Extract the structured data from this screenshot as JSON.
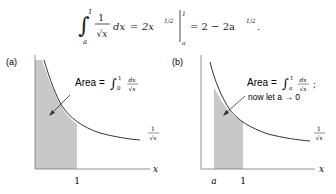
{
  "equation": {
    "lower_limit": "a",
    "upper_limit": "1",
    "integrand_numerator": "1",
    "integrand_denominator": "√x",
    "differential": "dx",
    "antiderivative_coef": "2x",
    "antiderivative_exp": "1/2",
    "eval_upper": "1",
    "eval_lower": "a",
    "result": "= 2 − 2a",
    "result_exp": "1/2",
    "result_end": "."
  },
  "panel_a": {
    "label": "(a)",
    "area_text": "Area =",
    "int_lower": "0",
    "int_upper": "1",
    "frac_num": "dx",
    "frac_den": "√x",
    "curve_label_num": "1",
    "curve_label_den": "√x",
    "x_axis_label": "x",
    "tick_1": "1"
  },
  "panel_b": {
    "label": "(b)",
    "area_text": "Area =",
    "int_lower": "a",
    "int_upper": "1",
    "frac_num": "dx",
    "frac_den": "√x",
    "semicolon": ";",
    "note": "now let a → 0",
    "curve_label_num": "1",
    "curve_label_den": "√x",
    "x_axis_label": "x",
    "tick_a": "a",
    "tick_1": "1"
  },
  "colors": {
    "shade": "#c8c8c8",
    "curve": "#333333",
    "axis": "#555555"
  }
}
